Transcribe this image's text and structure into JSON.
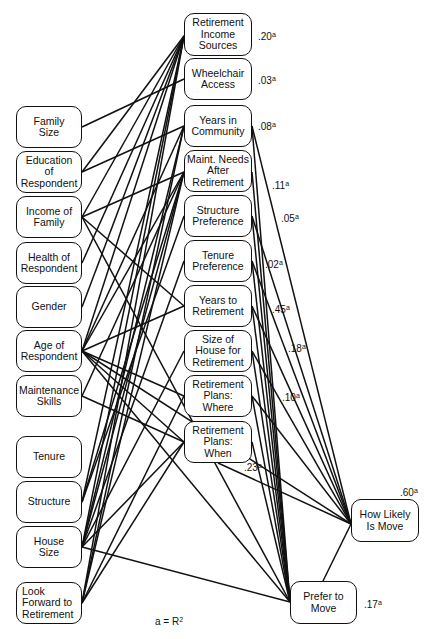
{
  "diagram": {
    "note": {
      "text": "a = R",
      "sup": "2",
      "x": 155,
      "y": 616
    },
    "nodes": [
      {
        "id": "family_size",
        "label": "Family\nSize",
        "x": 16,
        "y": 106,
        "w": 66,
        "h": 42
      },
      {
        "id": "education",
        "label": "Education\nof\nRespondent",
        "x": 16,
        "y": 151,
        "w": 66,
        "h": 42
      },
      {
        "id": "income",
        "label": "Income of\nFamily",
        "x": 16,
        "y": 196,
        "w": 66,
        "h": 42
      },
      {
        "id": "health",
        "label": "Health of\nRespondent",
        "x": 16,
        "y": 242,
        "w": 66,
        "h": 42
      },
      {
        "id": "gender",
        "label": "Gender",
        "x": 16,
        "y": 286,
        "w": 66,
        "h": 42
      },
      {
        "id": "age",
        "label": "Age of\nRespondent",
        "x": 16,
        "y": 330,
        "w": 66,
        "h": 42
      },
      {
        "id": "maint_skills",
        "label": "Maintenance\nSkills",
        "x": 16,
        "y": 375,
        "w": 66,
        "h": 42
      },
      {
        "id": "tenure",
        "label": "Tenure",
        "x": 16,
        "y": 436,
        "w": 66,
        "h": 42
      },
      {
        "id": "structure",
        "label": "Structure",
        "x": 16,
        "y": 481,
        "w": 66,
        "h": 42
      },
      {
        "id": "house_size",
        "label": "House\nSize",
        "x": 16,
        "y": 526,
        "w": 66,
        "h": 42
      },
      {
        "id": "look_forward",
        "label": "Look\nForward to\nRetirement",
        "x": 16,
        "y": 582,
        "w": 66,
        "h": 42,
        "align": "left"
      },
      {
        "id": "ret_income",
        "label": "Retirement\nIncome\nSources",
        "x": 184,
        "y": 13,
        "w": 68,
        "h": 43
      },
      {
        "id": "wheelchair",
        "label": "Wheelchair\nAccess",
        "x": 184,
        "y": 58,
        "w": 68,
        "h": 42
      },
      {
        "id": "years_comm",
        "label": "Years in\nCommunity",
        "x": 184,
        "y": 105,
        "w": 68,
        "h": 42
      },
      {
        "id": "maint_needs",
        "label": "Maint. Needs\nAfter\nRetirement",
        "x": 184,
        "y": 150,
        "w": 68,
        "h": 42
      },
      {
        "id": "struct_pref",
        "label": "Structure\nPreference",
        "x": 184,
        "y": 195,
        "w": 68,
        "h": 42
      },
      {
        "id": "tenure_pref",
        "label": "Tenure\nPreference",
        "x": 184,
        "y": 240,
        "w": 68,
        "h": 42
      },
      {
        "id": "years_ret",
        "label": "Years to\nRetirement",
        "x": 184,
        "y": 285,
        "w": 68,
        "h": 42
      },
      {
        "id": "size_house_ret",
        "label": "Size of\nHouse for\nRetirement",
        "x": 184,
        "y": 330,
        "w": 68,
        "h": 42
      },
      {
        "id": "plans_where",
        "label": "Retirement\nPlans:\n      Where",
        "x": 184,
        "y": 375,
        "w": 68,
        "h": 42
      },
      {
        "id": "plans_when",
        "label": "Retirement\nPlans:\n      When",
        "x": 184,
        "y": 421,
        "w": 68,
        "h": 42
      },
      {
        "id": "how_likely",
        "label": "How Likely\nIs Move",
        "x": 351,
        "y": 499,
        "w": 68,
        "h": 43
      },
      {
        "id": "prefer_move",
        "label": "Prefer to\nMove",
        "x": 290,
        "y": 581,
        "w": 67,
        "h": 43
      }
    ],
    "r2_labels": [
      {
        "target": "ret_income",
        "value": ".20",
        "sup": "a",
        "x": 258,
        "y": 32
      },
      {
        "target": "wheelchair",
        "value": ".03",
        "sup": "a",
        "x": 258,
        "y": 76
      },
      {
        "target": "years_comm",
        "value": ".08",
        "sup": "a",
        "x": 258,
        "y": 122
      },
      {
        "target": "maint_needs",
        "value": ".11",
        "sup": "a",
        "x": 272,
        "y": 181
      },
      {
        "target": "struct_pref",
        "value": ".05",
        "sup": "a",
        "x": 281,
        "y": 214
      },
      {
        "target": "tenure_pref",
        "value": ".02",
        "sup": "a",
        "x": 265,
        "y": 260
      },
      {
        "target": "years_ret",
        "value": ".45",
        "sup": "a",
        "x": 272,
        "y": 305
      },
      {
        "target": "size_house_ret",
        "value": ".18",
        "sup": "a",
        "x": 288,
        "y": 344
      },
      {
        "target": "plans_where",
        "value": ".10",
        "sup": "a",
        "x": 282,
        "y": 393
      },
      {
        "target": "plans_when",
        "value": ".23",
        "sup": "a",
        "x": 244,
        "y": 463
      },
      {
        "target": "how_likely",
        "value": ".60",
        "sup": "a",
        "x": 400,
        "y": 488
      },
      {
        "target": "prefer_move",
        "value": ".17",
        "sup": "a",
        "x": 364,
        "y": 600
      }
    ],
    "edges": [
      [
        82,
        127,
        184,
        79
      ],
      [
        82,
        172,
        184,
        36
      ],
      [
        82,
        172,
        184,
        126
      ],
      [
        82,
        217,
        184,
        36
      ],
      [
        82,
        217,
        184,
        172
      ],
      [
        82,
        217,
        184,
        306
      ],
      [
        82,
        217,
        290,
        602
      ],
      [
        82,
        263,
        184,
        36
      ],
      [
        82,
        307,
        184,
        36
      ],
      [
        82,
        351,
        184,
        36
      ],
      [
        82,
        351,
        184,
        126
      ],
      [
        82,
        351,
        184,
        172
      ],
      [
        82,
        351,
        184,
        306
      ],
      [
        82,
        351,
        184,
        396
      ],
      [
        82,
        351,
        184,
        442
      ],
      [
        82,
        351,
        290,
        602
      ],
      [
        82,
        351,
        351,
        524
      ],
      [
        82,
        396,
        184,
        172
      ],
      [
        82,
        396,
        184,
        442
      ],
      [
        82,
        502,
        184,
        36
      ],
      [
        82,
        502,
        184,
        172
      ],
      [
        82,
        502,
        184,
        216
      ],
      [
        82,
        547,
        184,
        36
      ],
      [
        82,
        547,
        184,
        126
      ],
      [
        82,
        547,
        184,
        172
      ],
      [
        82,
        547,
        184,
        261
      ],
      [
        82,
        547,
        184,
        351
      ],
      [
        82,
        547,
        184,
        442
      ],
      [
        82,
        547,
        290,
        602
      ],
      [
        82,
        603,
        184,
        36
      ],
      [
        82,
        603,
        184,
        126
      ],
      [
        82,
        603,
        184,
        172
      ],
      [
        82,
        603,
        184,
        396
      ],
      [
        82,
        603,
        184,
        442
      ],
      [
        252,
        126,
        290,
        602
      ],
      [
        252,
        126,
        351,
        524
      ],
      [
        252,
        172,
        290,
        602
      ],
      [
        252,
        216,
        290,
        602
      ],
      [
        252,
        216,
        351,
        524
      ],
      [
        252,
        261,
        290,
        602
      ],
      [
        252,
        261,
        351,
        524
      ],
      [
        252,
        306,
        290,
        602
      ],
      [
        252,
        306,
        351,
        524
      ],
      [
        252,
        351,
        290,
        602
      ],
      [
        252,
        351,
        351,
        524
      ],
      [
        252,
        396,
        290,
        602
      ],
      [
        252,
        396,
        351,
        524
      ],
      [
        252,
        442,
        290,
        602
      ],
      [
        218,
        463,
        351,
        524
      ],
      [
        323,
        581,
        351,
        524
      ]
    ]
  }
}
